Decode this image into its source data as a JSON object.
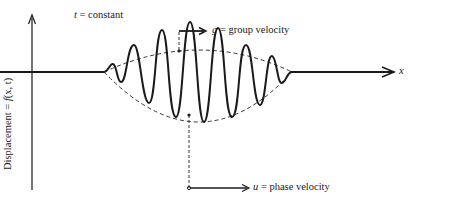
{
  "figure": {
    "condition_label": {
      "var": "t",
      "rest": " = constant"
    },
    "y_axis_label": {
      "prefix": "Displacement = ",
      "func": "f",
      "args": "(x, t)"
    },
    "x_axis_label": "x",
    "group_velocity": {
      "var": "g",
      "rest": " = group  velocity"
    },
    "phase_velocity": {
      "var": "u",
      "rest": " = phase  velocity"
    }
  },
  "colors": {
    "ink": "#1a1a1a",
    "background": "#ffffff"
  }
}
